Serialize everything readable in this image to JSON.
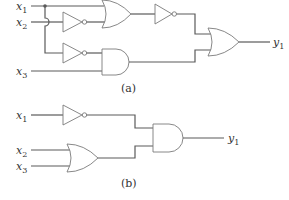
{
  "diagram": {
    "type": "logic-circuit",
    "wire_color": "#5a5a5a",
    "gate_stroke_color": "#7a7a7a",
    "circuit_a": {
      "caption": "(a)",
      "inputs": [
        {
          "name": "x",
          "sub": "1"
        },
        {
          "name": "x",
          "sub": "2"
        },
        {
          "name": "x",
          "sub": "3"
        }
      ],
      "output": {
        "name": "y",
        "sub": "1"
      },
      "gates": [
        "NOT (x2)",
        "OR (x1, NOT x2)",
        "NOT (OR output)",
        "NOT (x1)",
        "AND (NOT x1, x3)",
        "OR (final)"
      ]
    },
    "circuit_b": {
      "caption": "(b)",
      "inputs": [
        {
          "name": "x",
          "sub": "1"
        },
        {
          "name": "x",
          "sub": "2"
        },
        {
          "name": "x",
          "sub": "3"
        }
      ],
      "output": {
        "name": "y",
        "sub": "1"
      },
      "gates": [
        "NOT (x1)",
        "OR (x2, x3)",
        "AND (final)"
      ]
    }
  }
}
